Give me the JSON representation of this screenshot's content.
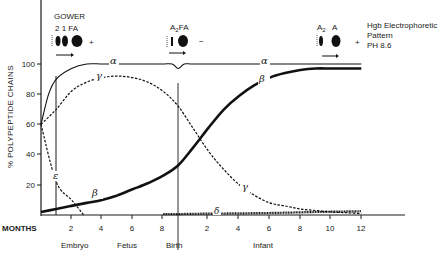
{
  "chart_data": {
    "type": "line",
    "title": "",
    "xlabel": "MONTHS",
    "ylabel": "% POLYPEPTIDE CHAINS",
    "ylim": [
      0,
      100
    ],
    "y_ticks": [
      20,
      40,
      60,
      80,
      100
    ],
    "x_axis_note": "x measured in months from conception; birth at 9; infant months = 9 + infant age",
    "x_tick_labels_prenatal": [
      "2",
      "4",
      "6",
      "8"
    ],
    "x_tick_labels_infant": [
      "2",
      "4",
      "6",
      "8",
      "10",
      "12"
    ],
    "stages": [
      "Embryo",
      "Fetus",
      "Birth",
      "Infant"
    ],
    "grid": false,
    "series": [
      {
        "name": "α",
        "style": "solid-thin",
        "x": [
          0,
          0.5,
          1,
          2,
          3,
          4,
          5,
          6,
          7,
          8,
          8.6,
          9,
          9.4,
          10,
          12,
          14,
          16,
          18,
          21
        ],
        "values": [
          60,
          80,
          90,
          97,
          100,
          100,
          100,
          100,
          100,
          100,
          100,
          97,
          100,
          100,
          100,
          100,
          100,
          100,
          100
        ]
      },
      {
        "name": "γ",
        "style": "dashed",
        "x": [
          0,
          1,
          2,
          3,
          4,
          5,
          6,
          7,
          8,
          9,
          10,
          11,
          12,
          13,
          14,
          15,
          16,
          17,
          18,
          19,
          20,
          21
        ],
        "values": [
          60,
          70,
          82,
          88,
          91,
          92,
          91,
          88,
          82,
          72,
          57,
          42,
          30,
          20,
          13,
          8,
          6,
          4,
          3,
          2,
          1.5,
          1
        ]
      },
      {
        "name": "β",
        "style": "solid-thick",
        "x": [
          0,
          1,
          2,
          3,
          4,
          5,
          6,
          7,
          8,
          9,
          10,
          11,
          12,
          13,
          14,
          15,
          16,
          17,
          18,
          19,
          20,
          21
        ],
        "values": [
          2,
          4,
          6,
          8,
          10,
          13,
          17,
          21,
          26,
          33,
          45,
          58,
          70,
          79,
          86,
          91,
          94,
          96,
          97,
          97,
          97,
          97
        ]
      },
      {
        "name": "ε",
        "style": "dashed",
        "x": [
          0,
          1,
          2,
          2.8
        ],
        "values": [
          60,
          22,
          10,
          0
        ]
      },
      {
        "name": "δ",
        "style": "hatched",
        "x": [
          8,
          9,
          10,
          12,
          14,
          16,
          18,
          21
        ],
        "values": [
          0.5,
          0.6,
          0.8,
          1,
          1.2,
          1.5,
          2,
          2.5
        ]
      }
    ],
    "annotations": [
      {
        "text": "GOWER",
        "position": "top-left above embryo"
      },
      {
        "text": "2 1 FA",
        "position": "gel pattern embryo",
        "sign": "+"
      },
      {
        "text": "A2FA",
        "position": "gel pattern at birth",
        "sign": "−"
      },
      {
        "text": "A2 A",
        "position": "gel pattern infant",
        "sign": "+"
      },
      {
        "text": "Hgb Electrophoretic Pattern PH 8.6",
        "position": "top-right legend"
      }
    ]
  },
  "labels": {
    "y_axis_title": "% POLYPEPTIDE CHAINS",
    "months": "MONTHS",
    "y_ticks": [
      "100",
      "80",
      "60",
      "40",
      "20"
    ],
    "prenatal_ticks": [
      "2",
      "4",
      "6",
      "8"
    ],
    "infant_ticks": [
      "2",
      "4",
      "6",
      "8",
      "10",
      "12"
    ],
    "stage_embryo": "Embryo",
    "stage_fetus": "Fetus",
    "stage_birth": "Birth",
    "stage_infant": "Infant",
    "alpha": "α",
    "gamma": "γ",
    "beta": "β",
    "epsilon": "ε",
    "delta": "δ"
  },
  "gels": {
    "gower_title": "GOWER",
    "gower_bands": "2  1  FA",
    "gower_sign": "+",
    "birth_bands_a": "A",
    "birth_bands_sub": "2",
    "birth_bands_b": "FA",
    "birth_sign": "−",
    "infant_a2": "A",
    "infant_a2_sub": "2",
    "infant_a": "A",
    "infant_sign": "+",
    "legend_line1": "Hgb Electrophoretic",
    "legend_line2": "Pattern",
    "legend_line3": "PH 8.6"
  }
}
